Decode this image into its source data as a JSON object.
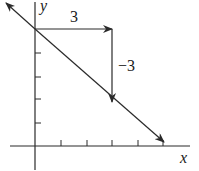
{
  "diagram": {
    "type": "slope-triangle",
    "axes": {
      "x_label": "x",
      "y_label": "y"
    },
    "run_label": "3",
    "rise_label": "−3",
    "colors": {
      "line": "#2a2a2a",
      "background": "#ffffff"
    },
    "x_ticks": 5,
    "y_ticks": 4
  }
}
